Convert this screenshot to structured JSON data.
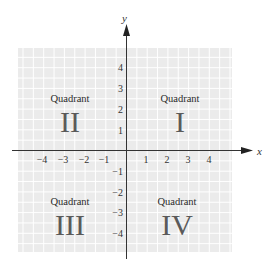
{
  "diagram": {
    "colors": {
      "grid_background": "#ebebeb",
      "grid_lines": "#ffffff",
      "axis": "#333333",
      "numeral": "#5a5a5a",
      "text": "#2a2a2a"
    },
    "axes": {
      "x_label": "x",
      "y_label": "y",
      "x_ticks": [
        {
          "value": -4,
          "label": "−4"
        },
        {
          "value": -3,
          "label": "−3"
        },
        {
          "value": -2,
          "label": "−2"
        },
        {
          "value": -1,
          "label": "−1"
        },
        {
          "value": 1,
          "label": "1"
        },
        {
          "value": 2,
          "label": "2"
        },
        {
          "value": 3,
          "label": "3"
        },
        {
          "value": 4,
          "label": "4"
        }
      ],
      "y_ticks": [
        {
          "value": 4,
          "label": "4"
        },
        {
          "value": 3,
          "label": "3"
        },
        {
          "value": 2,
          "label": "2"
        },
        {
          "value": 1,
          "label": "1"
        },
        {
          "value": -1,
          "label": "−1"
        },
        {
          "value": -2,
          "label": "−2"
        },
        {
          "value": -3,
          "label": "−3"
        },
        {
          "value": -4,
          "label": "−4"
        }
      ]
    },
    "quadrants": [
      {
        "id": "I",
        "word": "Quadrant",
        "numeral": "I"
      },
      {
        "id": "II",
        "word": "Quadrant",
        "numeral": "II"
      },
      {
        "id": "III",
        "word": "Quadrant",
        "numeral": "III"
      },
      {
        "id": "IV",
        "word": "Quadrant",
        "numeral": "IV"
      }
    ]
  }
}
